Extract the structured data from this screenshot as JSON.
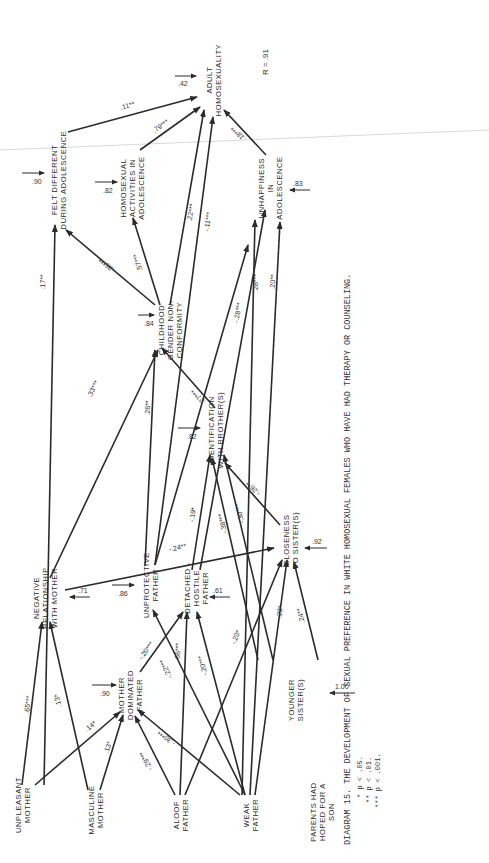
{
  "diagram": {
    "caption": "DIAGRAM 15.  THE DEVELOPMENT OF SEXUAL PREFERENCE IN WHITE HOMOSEXUAL FEMALES WHO HAVE HAD THERAPY OR COUNSELING.",
    "legend": [
      "*  p < .05.",
      "**  p < .01.",
      "***  p < .001."
    ],
    "r_value": "R = .91",
    "nodes": [
      {
        "id": "unpleasant_mother",
        "lines": [
          "UNPLEASANT",
          "MOTHER"
        ],
        "x": 22,
        "y": 805
      },
      {
        "id": "masculine_mother",
        "lines": [
          "MASCULINE",
          "MOTHER"
        ],
        "x": 95,
        "y": 810
      },
      {
        "id": "aloof_father",
        "lines": [
          "ALOOF",
          "FATHER"
        ],
        "x": 180,
        "y": 815
      },
      {
        "id": "weak_father",
        "lines": [
          "WEAK",
          "FATHER"
        ],
        "x": 250,
        "y": 815
      },
      {
        "id": "parents_hoped_son",
        "lines": [
          "PARENTS HAD",
          "HOPED FOR A",
          "SON"
        ],
        "x": 322,
        "y": 812
      },
      {
        "id": "younger_sisters",
        "lines": [
          "YOUNGER",
          "SISTER(S)"
        ],
        "x": 295,
        "y": 700
      },
      {
        "id": "mother_dominated_father",
        "lines": [
          "MOTHER",
          "DOMINATED",
          "FATHER"
        ],
        "x": 130,
        "y": 695
      },
      {
        "id": "negative_relationship_mother",
        "lines": [
          "NEGATIVE",
          "RELATIONSHIP",
          "WITH MOTHER"
        ],
        "x": 45,
        "y": 598
      },
      {
        "id": "unprotective_father",
        "lines": [
          "UNPROTECTIVE",
          "FATHER"
        ],
        "x": 150,
        "y": 585
      },
      {
        "id": "detached_hostile_father",
        "lines": [
          "DETACHED -",
          "HOSTILE",
          "FATHER"
        ],
        "x": 196,
        "y": 588
      },
      {
        "id": "closeness_sisters",
        "lines": [
          "CLOSENESS",
          "TO SISTER(S)"
        ],
        "x": 290,
        "y": 540
      },
      {
        "id": "identification_brothers",
        "lines": [
          "IDENTIFICATION",
          "WITH BROTHER(S)"
        ],
        "x": 215,
        "y": 430
      },
      {
        "id": "childhood_gnc",
        "lines": [
          "CHILDHOOD",
          "GENDER NON-",
          "CONFORMITY"
        ],
        "x": 170,
        "y": 330
      },
      {
        "id": "felt_different",
        "lines": [
          "FELT  DIFFERENT",
          "DURING  ADOLESCENCE"
        ],
        "x": 58,
        "y": 180
      },
      {
        "id": "homosexual_activities",
        "lines": [
          "HOMOSEXUAL",
          "ACTIVITIES IN",
          "ADOLESCENCE"
        ],
        "x": 132,
        "y": 188
      },
      {
        "id": "unhappiness",
        "lines": [
          "UNHAPPINESS",
          "IN",
          "ADOLESCENCE"
        ],
        "x": 270,
        "y": 188
      },
      {
        "id": "adult_homosexuality",
        "lines": [
          "ADULT",
          "HOMOSEXUALITY"
        ],
        "x": 213,
        "y": 80
      }
    ],
    "edges": [
      {
        "from": [
          22,
          785
        ],
        "to": [
          42,
          622
        ],
        "label": ".65***",
        "lx": 30,
        "ly": 705
      },
      {
        "from": [
          88,
          790
        ],
        "to": [
          50,
          622
        ],
        "label": ".13*",
        "lx": 60,
        "ly": 700
      },
      {
        "from": [
          35,
          785
        ],
        "to": [
          120,
          712
        ],
        "label": ".14*",
        "lx": 92,
        "ly": 728
      },
      {
        "from": [
          100,
          790
        ],
        "to": [
          123,
          715
        ],
        "label": ".13*",
        "lx": 110,
        "ly": 748
      },
      {
        "from": [
          175,
          795
        ],
        "to": [
          135,
          716
        ],
        "label": "-.29***",
        "lx": 148,
        "ly": 760
      },
      {
        "from": [
          240,
          795
        ],
        "to": [
          138,
          710
        ],
        "label": "-.30***",
        "lx": 168,
        "ly": 736
      },
      {
        "from": [
          140,
          672
        ],
        "to": [
          183,
          612
        ],
        "label": "-.20***",
        "lx": 148,
        "ly": 652
      },
      {
        "from": [
          180,
          795
        ],
        "to": [
          187,
          612
        ],
        "label": ".66***",
        "lx": 180,
        "ly": 652
      },
      {
        "from": [
          245,
          795
        ],
        "to": [
          153,
          610
        ],
        "label": "-.22***",
        "lx": 168,
        "ly": 668
      },
      {
        "from": [
          245,
          795
        ],
        "to": [
          197,
          612
        ],
        "label": "-.20***",
        "lx": 205,
        "ly": 665
      },
      {
        "from": [
          185,
          795
        ],
        "to": [
          282,
          560
        ],
        "label": "-.20*",
        "lx": 238,
        "ly": 638
      },
      {
        "from": [
          255,
          795
        ],
        "to": [
          287,
          560
        ],
        "label": ".23*",
        "lx": 282,
        "ly": 612
      },
      {
        "from": [
          318,
          660
        ],
        "to": [
          294,
          562
        ],
        "label": ".24**",
        "lx": 303,
        "ly": 615
      },
      {
        "from": [
          65,
          590
        ],
        "to": [
          274,
          548
        ],
        "label": "-.24**",
        "lx": 178,
        "ly": 550
      },
      {
        "from": [
          50,
          578
        ],
        "to": [
          158,
          350
        ],
        "label": ".33***",
        "lx": 95,
        "ly": 390
      },
      {
        "from": [
          145,
          566
        ],
        "to": [
          155,
          350
        ],
        "label": ".26**",
        "lx": 150,
        "ly": 408
      },
      {
        "from": [
          155,
          565
        ],
        "to": [
          248,
          245
        ],
        "label": "",
        "lx": 0,
        "ly": 0
      },
      {
        "from": [
          192,
          570
        ],
        "to": [
          210,
          455
        ],
        "label": "-.19*",
        "lx": 195,
        "ly": 515
      },
      {
        "from": [
          200,
          570
        ],
        "to": [
          265,
          210
        ],
        "label": "-.28***",
        "lx": 240,
        "ly": 313
      },
      {
        "from": [
          280,
          525
        ],
        "to": [
          225,
          463
        ],
        "label": "-.26**",
        "lx": 255,
        "ly": 487
      },
      {
        "from": [
          258,
          660
        ],
        "to": [
          212,
          458
        ],
        "label": "-.38***",
        "lx": 225,
        "ly": 523
      },
      {
        "from": [
          273,
          660
        ],
        "to": [
          224,
          455
        ],
        "label": "-.30***",
        "lx": 242,
        "ly": 513
      },
      {
        "from": [
          215,
          408
        ],
        "to": [
          162,
          348
        ],
        "label": ".27***",
        "lx": 200,
        "ly": 395
      },
      {
        "from": [
          155,
          305
        ],
        "to": [
          66,
          230
        ],
        "label": ".36***",
        "lx": 108,
        "ly": 263
      },
      {
        "from": [
          160,
          305
        ],
        "to": [
          133,
          218
        ],
        "label": ".57***",
        "lx": 140,
        "ly": 262
      },
      {
        "from": [
          170,
          305
        ],
        "to": [
          204,
          110
        ],
        "label": ".22***",
        "lx": 193,
        "ly": 213
      },
      {
        "from": [
          155,
          565
        ],
        "to": [
          213,
          117
        ],
        "label": "-.11***",
        "lx": 210,
        "ly": 222
      },
      {
        "from": [
          242,
          795
        ],
        "to": [
          255,
          220
        ],
        "label": ".28***",
        "lx": 258,
        "ly": 283
      },
      {
        "from": [
          250,
          795
        ],
        "to": [
          280,
          222
        ],
        "label": ".20**",
        "lx": 275,
        "ly": 282
      },
      {
        "from": [
          44,
          785
        ],
        "to": [
          55,
          225
        ],
        "label": ".17**",
        "lx": 45,
        "ly": 282
      },
      {
        "from": [
          68,
          132
        ],
        "to": [
          197,
          97
        ],
        "label": ".11**",
        "lx": 128,
        "ly": 108
      },
      {
        "from": [
          140,
          150
        ],
        "to": [
          200,
          107
        ],
        "label": ".79***",
        "lx": 162,
        "ly": 128
      },
      {
        "from": [
          266,
          155
        ],
        "to": [
          224,
          110
        ],
        "label": ".18***",
        "lx": 240,
        "ly": 132
      }
    ],
    "residuals": [
      {
        "node": "adult_homosexuality",
        "value": ".42",
        "x1": 175,
        "y1": 76,
        "x2": 196,
        "y2": 76,
        "lx": 178,
        "ly": 86
      },
      {
        "node": "felt_different",
        "value": ".90",
        "x1": 22,
        "y1": 173,
        "x2": 44,
        "y2": 173,
        "lx": 32,
        "ly": 184
      },
      {
        "node": "homosexual_activities",
        "value": ".82",
        "x1": 95,
        "y1": 182,
        "x2": 117,
        "y2": 182,
        "lx": 103,
        "ly": 193
      },
      {
        "node": "unhappiness",
        "value": ".83",
        "x1": 310,
        "y1": 190,
        "x2": 290,
        "y2": 190,
        "lx": 293,
        "ly": 186
      },
      {
        "node": "childhood_gnc",
        "value": ".84",
        "x1": 138,
        "y1": 315,
        "x2": 154,
        "y2": 315,
        "lx": 144,
        "ly": 326
      },
      {
        "node": "identification_brothers",
        "value": ".82",
        "x1": 178,
        "y1": 428,
        "x2": 200,
        "y2": 428,
        "lx": 187,
        "ly": 439
      },
      {
        "node": "negative_relationship_mother",
        "value": ".71",
        "x1": 90,
        "y1": 597,
        "x2": 70,
        "y2": 597,
        "lx": 78,
        "ly": 593
      },
      {
        "node": "unprotective_father",
        "value": ".86",
        "x1": 112,
        "y1": 585,
        "x2": 134,
        "y2": 585,
        "lx": 118,
        "ly": 596
      },
      {
        "node": "detached_hostile_father",
        "value": ".61",
        "x1": 230,
        "y1": 597,
        "x2": 210,
        "y2": 597,
        "lx": 213,
        "ly": 593
      },
      {
        "node": "closeness_sisters",
        "value": ".92",
        "x1": 327,
        "y1": 548,
        "x2": 305,
        "y2": 548,
        "lx": 312,
        "ly": 544
      },
      {
        "node": "mother_dominated_father",
        "value": ".90",
        "x1": 92,
        "y1": 685,
        "x2": 116,
        "y2": 685,
        "lx": 100,
        "ly": 696
      },
      {
        "node": "younger_sisters",
        "value": "1.00",
        "x1": 355,
        "y1": 693,
        "x2": 330,
        "y2": 693,
        "lx": 335,
        "ly": 689
      }
    ]
  }
}
